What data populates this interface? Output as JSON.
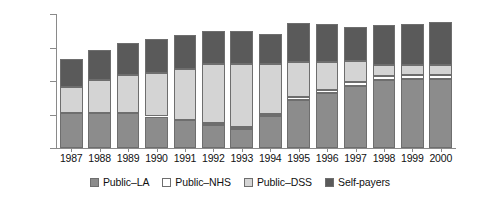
{
  "chart_data": {
    "type": "bar",
    "stacked": true,
    "title": "",
    "subtitle": "",
    "xlabel": "",
    "ylabel": "",
    "ylim": [
      0,
      400000
    ],
    "yticks": [
      0,
      100000,
      200000,
      300000,
      400000
    ],
    "ytick_labels": [
      "0",
      "100,000",
      "200,000",
      "300,000",
      "400,000"
    ],
    "grid": false,
    "legend_position": "bottom",
    "categories": [
      "1987",
      "1988",
      "1989",
      "1990",
      "1991",
      "1992",
      "1993",
      "1994",
      "1995",
      "1996",
      "1997",
      "1998",
      "1999",
      "2000"
    ],
    "series": [
      {
        "name": "Public-LA",
        "color": "#8c8c8c",
        "values": [
          104000,
          104000,
          103000,
          94000,
          84000,
          69000,
          56000,
          95000,
          143000,
          163000,
          186000,
          204000,
          205000,
          206000
        ]
      },
      {
        "name": "Public-NHS",
        "color": "#ffffff",
        "values": [
          0,
          0,
          0,
          0,
          0,
          5000,
          7000,
          7000,
          10000,
          11000,
          12000,
          12000,
          12000,
          12000
        ]
      },
      {
        "name": "Public-DSS",
        "color": "#d4d4d4",
        "values": [
          77000,
          98000,
          114000,
          129000,
          153000,
          176000,
          187000,
          148000,
          103000,
          83000,
          63000,
          33000,
          31000,
          30000
        ]
      },
      {
        "name": "Self-payers",
        "color": "#5a5a5a",
        "values": [
          86000,
          90000,
          95000,
          103000,
          101000,
          100000,
          100000,
          89000,
          117000,
          113000,
          100000,
          119000,
          123000,
          128000
        ]
      }
    ],
    "totals": [
      267000,
      292000,
      312000,
      326000,
      338000,
      350000,
      350000,
      339000,
      373000,
      370000,
      361000,
      368000,
      371000,
      376000
    ]
  },
  "legend": {
    "items": [
      {
        "label": "Public–LA",
        "swatch": "legend-swatch-public-la"
      },
      {
        "label": "Public–NHS",
        "swatch": "legend-swatch-public-nhs"
      },
      {
        "label": "Public–DSS",
        "swatch": "legend-swatch-public-dss"
      },
      {
        "label": "Self-payers",
        "swatch": "legend-swatch-self-payers"
      }
    ]
  }
}
